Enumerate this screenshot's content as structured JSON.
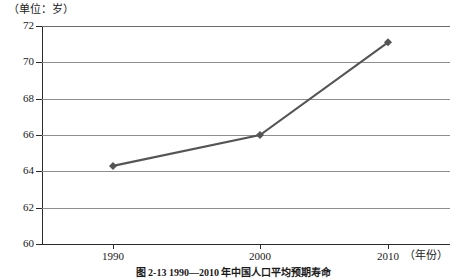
{
  "unit_label": "（单位：岁）",
  "x_axis_title": "（年份）",
  "figure_caption": "图 2-13  1990—2010 年中国人口平均预期寿命",
  "colors": {
    "series_line": "#555555",
    "gridline": "#8e8e8e",
    "axis": "#2a2a2a",
    "background": "#ffffff"
  },
  "y_ticks": [
    {
      "label": "72",
      "value": 72
    },
    {
      "label": "70",
      "value": 70
    },
    {
      "label": "68",
      "value": 68
    },
    {
      "label": "66",
      "value": 66
    },
    {
      "label": "64",
      "value": 64
    },
    {
      "label": "62",
      "value": 62
    },
    {
      "label": "60",
      "value": 60
    }
  ],
  "x_ticks": [
    {
      "label": "1990",
      "value": 1990
    },
    {
      "label": "2000",
      "value": 2000
    },
    {
      "label": "2010",
      "value": 2010
    }
  ],
  "chart_data": {
    "type": "line",
    "title": "图 2-13  1990—2010 年中国人口平均预期寿命",
    "xlabel": "（年份）",
    "ylabel": "（单位：岁）",
    "categories": [
      "1990",
      "2000",
      "2010"
    ],
    "x": [
      1990,
      2000,
      2010
    ],
    "values": [
      64.3,
      66.0,
      71.1
    ],
    "series": [
      {
        "name": "平均预期寿命",
        "values": [
          64.3,
          66.0,
          71.1
        ]
      }
    ],
    "ylim": [
      60,
      72
    ],
    "yticks": [
      60,
      62,
      64,
      66,
      68,
      70,
      72
    ],
    "xticks": [
      1990,
      2000,
      2010
    ],
    "grid": true,
    "grid_axis": "y",
    "legend": false,
    "marker": "diamond",
    "line_color": "#555555"
  }
}
